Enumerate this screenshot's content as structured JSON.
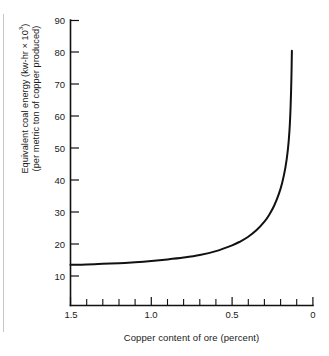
{
  "figure": {
    "background_color": "#ffffff",
    "line_color": "#111111",
    "margin_rule_color": "#c6c6c6"
  },
  "axes": {
    "y": {
      "title_line1_prefix": "Equivalent coal energy (kw-hr × 10",
      "title_line1_exponent": "3",
      "title_line1_suffix": ")",
      "title_line2": "(per metric ton of copper produced)",
      "tick_labels": [
        "90",
        "80",
        "70",
        "60",
        "50",
        "40",
        "30",
        "20",
        "10"
      ],
      "tick_values": [
        90,
        80,
        70,
        60,
        50,
        40,
        30,
        20,
        10
      ]
    },
    "x": {
      "title": "Copper content of ore (percent)",
      "tick_labels": [
        "1.5",
        "1.0",
        "0.5",
        "0"
      ],
      "tick_values": [
        1.5,
        1.0,
        0.5,
        0.0
      ],
      "minor_tick_values": [
        1.4,
        1.3,
        1.2,
        1.1,
        0.9,
        0.8,
        0.7,
        0.6,
        0.4,
        0.3,
        0.2,
        0.1
      ]
    }
  },
  "chart_data": {
    "type": "line",
    "title": "",
    "xlabel": "Copper content of ore (percent)",
    "ylabel": "Equivalent coal energy (kw-hr × 10^3) (per metric ton of copper produced)",
    "xlim": [
      1.5,
      0.0
    ],
    "ylim": [
      5,
      90
    ],
    "x_reversed": true,
    "grid": false,
    "legend": null,
    "xticks": [
      1.5,
      1.0,
      0.5,
      0.0
    ],
    "xtick_labels": [
      "1.5",
      "1.0",
      "0.5",
      "0"
    ],
    "x_minor_ticks": [
      1.4,
      1.3,
      1.2,
      1.1,
      0.9,
      0.8,
      0.7,
      0.6,
      0.4,
      0.3,
      0.2,
      0.1
    ],
    "yticks": [
      10,
      20,
      30,
      40,
      50,
      60,
      70,
      80,
      90
    ],
    "ytick_labels": [
      "10",
      "20",
      "30",
      "40",
      "50",
      "60",
      "70",
      "80",
      "90"
    ],
    "series": [
      {
        "name": "Equivalent coal energy",
        "x": [
          1.5,
          1.4,
          1.3,
          1.2,
          1.1,
          1.0,
          0.9,
          0.8,
          0.7,
          0.6,
          0.5,
          0.45,
          0.4,
          0.35,
          0.3,
          0.27,
          0.24,
          0.21,
          0.19,
          0.17,
          0.155,
          0.145,
          0.138,
          0.133,
          0.13
        ],
        "y": [
          13.5,
          13.6,
          13.8,
          14.0,
          14.3,
          14.7,
          15.2,
          15.8,
          16.6,
          17.8,
          19.6,
          20.8,
          22.3,
          24.3,
          27.0,
          29.2,
          32.0,
          35.8,
          39.2,
          44.0,
          49.5,
          55.5,
          63.0,
          72.0,
          80.5
        ]
      }
    ]
  }
}
